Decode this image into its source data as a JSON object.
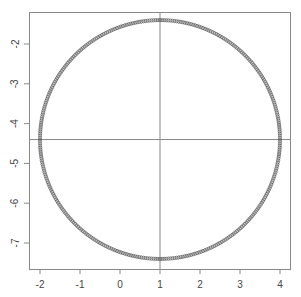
{
  "chart_data": {
    "type": "scatter",
    "title": "",
    "xlabel": "",
    "ylabel": "",
    "xlim": [
      -2.25,
      4.25
    ],
    "ylim": [
      -7.65,
      -1.15
    ],
    "grid": false,
    "legend": null,
    "x_ticks": [
      -2,
      -1,
      0,
      1,
      2,
      3,
      4
    ],
    "x_tick_labels": [
      "-2",
      "-1",
      "0",
      "1",
      "2",
      "3",
      "4"
    ],
    "y_ticks": [
      -2,
      -3,
      -4,
      -5,
      -6,
      -7
    ],
    "y_tick_labels": [
      "-2",
      "-3",
      "-4",
      "-5",
      "-6",
      "-7"
    ],
    "reference_lines": {
      "vertical_x": 1,
      "horizontal_y": -4.4
    },
    "series": [
      {
        "name": "circle",
        "shape": "circle of open-point markers",
        "center": [
          1,
          -4.4
        ],
        "radius": 3,
        "n_points": 360,
        "marker": "open-circle",
        "color": "#555555"
      }
    ]
  },
  "colors": {
    "axis": "#888888",
    "reference_line": "#888888",
    "points": "#555555",
    "tick_label": "#444444"
  }
}
